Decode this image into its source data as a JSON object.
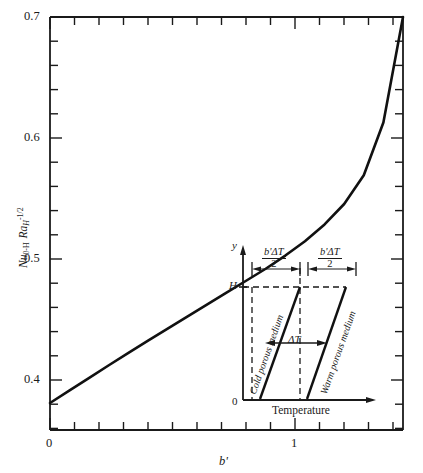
{
  "chart_data": {
    "type": "line",
    "title": "",
    "xlabel": "b'",
    "ylabel": "Nu0-H RaH^-1/2",
    "xlim": [
      0,
      1.44
    ],
    "ylim": [
      0.3555,
      0.7
    ],
    "grid": false,
    "legend": "none",
    "x_major_ticks": [
      0,
      1
    ],
    "x_major_tick_labels": [
      "0",
      "1"
    ],
    "x_minor_tick_count_per_unit": 10,
    "y_major_ticks": [
      0.4,
      0.5,
      0.6,
      0.7
    ],
    "y_major_tick_labels": [
      "0.4",
      "0.5",
      "0.6",
      "0.7"
    ],
    "y_minor_tick_step": 0.02,
    "series": [
      {
        "name": "Nu0-H RaH^-1/2 vs b'",
        "x": [
          0.0,
          0.08,
          0.16,
          0.24,
          0.32,
          0.4,
          0.48,
          0.56,
          0.64,
          0.72,
          0.8,
          0.88,
          0.96,
          1.04,
          1.12,
          1.2,
          1.28,
          1.36,
          1.44
        ],
        "y": [
          0.378,
          0.3885,
          0.399,
          0.4095,
          0.4198,
          0.43,
          0.44,
          0.45,
          0.46,
          0.47,
          0.48,
          0.49,
          0.501,
          0.513,
          0.527,
          0.544,
          0.568,
          0.612,
          0.7
        ]
      }
    ]
  },
  "axes": {
    "y_title_parts": {
      "nu": "Nu",
      "nu_sub": "0-H",
      "ra": "Ra",
      "ra_sub": "H",
      "ra_sup": "-1/2"
    },
    "x_title": "b'",
    "x_tick_labels": [
      "0",
      "1"
    ],
    "y_tick_labels": [
      "0.7",
      "0.6",
      "0.5",
      "0.4"
    ]
  },
  "inset": {
    "name": "temperature-profile-inset",
    "y_axis_label": "y",
    "x_axis_label": "Temperature",
    "top_tick_label": "H",
    "origin_label": "0",
    "delta_t_label": "ΔT",
    "dimension_label": {
      "numerator": "b'ΔT",
      "denominator": "2"
    },
    "dimension_label_left": {
      "numerator": "b'ΔT",
      "denominator": "2"
    },
    "dimension_label_right": {
      "numerator": "b'ΔT",
      "denominator": "2"
    },
    "cold_medium_label": "Cold porous medium",
    "warm_medium_label": "Warm porous medium"
  },
  "colors": {
    "ink": "#1a1a1a",
    "background": "#ffffff",
    "curve": "#111111"
  }
}
